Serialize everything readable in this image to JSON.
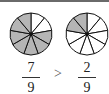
{
  "colors": {
    "shaded": "#b5b5b5",
    "unshaded": "#ffffff",
    "stroke": "#111111"
  },
  "left": {
    "parts": 9,
    "shaded": 7,
    "numerator": "7",
    "denominator": "9"
  },
  "right": {
    "parts": 9,
    "shaded": 2,
    "numerator": "2",
    "denominator": "9"
  },
  "comparison": ">"
}
